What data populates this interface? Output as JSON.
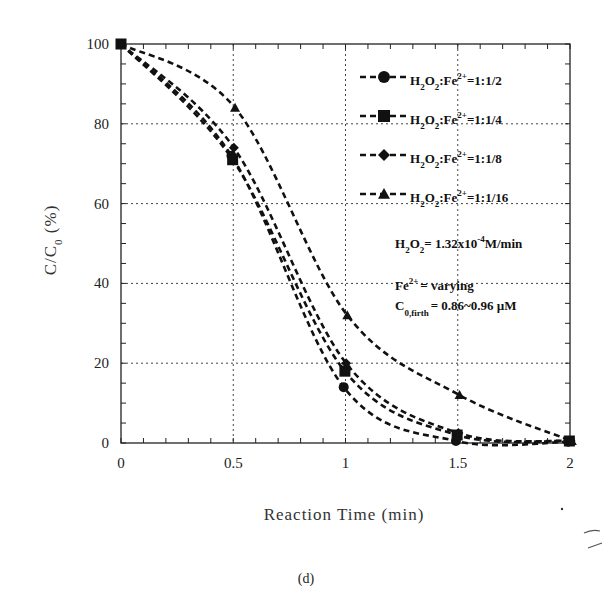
{
  "chart_data": {
    "type": "line",
    "title": "",
    "caption": "(d)",
    "xlabel": "Reaction Time (min)",
    "ylabel": "C/C0 (%)",
    "xlim": [
      0,
      2
    ],
    "ylim": [
      0,
      100
    ],
    "x_ticks": [
      "0",
      "0.5",
      "1",
      "1.5",
      "2"
    ],
    "y_ticks": [
      "0",
      "20",
      "40",
      "60",
      "80",
      "100"
    ],
    "grid": true,
    "legend_position": "upper right",
    "x": [
      0,
      0.5,
      1.0,
      1.5,
      2.0
    ],
    "series": [
      {
        "name": "H2O2:Fe2+=1:1/2",
        "marker": "circle",
        "values": [
          100,
          72,
          14,
          0.5,
          0.3
        ]
      },
      {
        "name": "H2O2:Fe2+=1:1/4",
        "marker": "square",
        "values": [
          100,
          71,
          18,
          2,
          0.5
        ]
      },
      {
        "name": "H2O2:Fe2+=1:1/8",
        "marker": "diamond",
        "values": [
          100,
          74,
          20,
          2.5,
          0.5
        ]
      },
      {
        "name": "H2O2:Fe2+=1:1/16",
        "marker": "triangle",
        "values": [
          100,
          84,
          32,
          12,
          0.5
        ]
      }
    ],
    "annotations": [
      "H2O2 = 1.32x10^-4 M/min",
      "Fe2+ = varying",
      "C0,firth = 0.86~0.96 µM"
    ]
  },
  "labels": {
    "xlabel": "Reaction Time (min)",
    "ylabel_main": "C/C",
    "ylabel_sub": "0",
    "ylabel_tail": " (%)",
    "caption": "(d)",
    "legend": [
      {
        "pre": "H",
        "s1": "2",
        "mid": "O",
        "s2": "2",
        "post": ":Fe",
        "sup": "2+",
        "ratio": "=1:1/2"
      },
      {
        "pre": "H",
        "s1": "2",
        "mid": "O",
        "s2": "2",
        "post": ":Fe",
        "sup": "2+",
        "ratio": "=1:1/4"
      },
      {
        "pre": "H",
        "s1": "2",
        "mid": "O",
        "s2": "2",
        "post": ":Fe",
        "sup": "2+",
        "ratio": "=1:1/8"
      },
      {
        "pre": "H",
        "s1": "2",
        "mid": "O",
        "s2": "2",
        "post": ":Fe",
        "sup": "2+",
        "ratio": "=1:1/16"
      }
    ],
    "ann1": {
      "h": "H",
      "s1": "2",
      "o": "O",
      "s2": "2",
      "eq": "= 1.32x10",
      "exp": "-4",
      "unit": "M/min"
    },
    "ann2": {
      "fe": "Fe",
      "sup": "2+",
      "rest": "= varying"
    },
    "ann3": {
      "c": "C",
      "sub": "0,firth",
      "rest": "= 0.86~0.96 µM"
    }
  }
}
